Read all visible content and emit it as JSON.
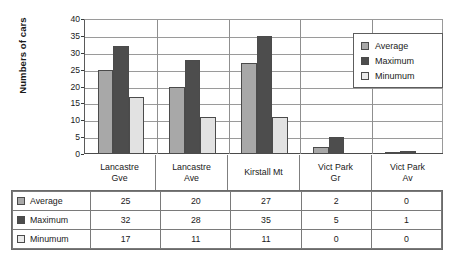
{
  "chart_data": {
    "type": "bar",
    "title": "",
    "xlabel": "",
    "ylabel": "Numbers of cars",
    "ylim": [
      0,
      40
    ],
    "ytick_labels": [
      "40",
      "35",
      "30",
      "25",
      "20",
      "15",
      "10",
      "5",
      "0"
    ],
    "ytick_values": [
      40,
      35,
      30,
      25,
      20,
      15,
      10,
      5,
      0
    ],
    "grid": true,
    "legend_position": "top-right",
    "categories": [
      "Lancastre Gve",
      "Lancastre Ave",
      "Kirstall Mt",
      "Vict Park Gr",
      "Vict Park Av"
    ],
    "category_lines": [
      [
        "Lancastre",
        "Gve"
      ],
      [
        "Lancastre",
        "Ave"
      ],
      [
        "Kirstall Mt",
        ""
      ],
      [
        "Vict Park",
        "Gr"
      ],
      [
        "Vict Park",
        "Av"
      ]
    ],
    "series": [
      {
        "name": "Average",
        "color": "#a8a8a8",
        "values": [
          25,
          20,
          27,
          2,
          0
        ]
      },
      {
        "name": "Maximum",
        "color": "#4d4d4d",
        "values": [
          32,
          28,
          35,
          5,
          1
        ]
      },
      {
        "name": "Minumum",
        "color": "#e2e2e2",
        "values": [
          17,
          11,
          11,
          0,
          0
        ]
      }
    ]
  },
  "legend": {
    "items": [
      {
        "label": "Average"
      },
      {
        "label": "Maximum"
      },
      {
        "label": "Minumum"
      }
    ]
  },
  "table": {
    "rows": [
      {
        "label": "Average",
        "values": [
          "25",
          "20",
          "27",
          "2",
          "0"
        ]
      },
      {
        "label": "Maximum",
        "values": [
          "32",
          "28",
          "35",
          "5",
          "1"
        ]
      },
      {
        "label": "Minumum",
        "values": [
          "17",
          "11",
          "11",
          "0",
          "0"
        ]
      }
    ]
  }
}
